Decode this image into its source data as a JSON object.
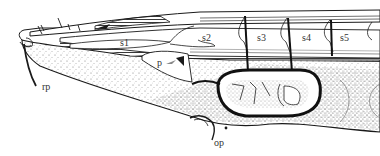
{
  "figure": {
    "type": "anatomical-illustration",
    "view": "lateral",
    "colors": {
      "ink": "#1a1a1a",
      "background": "#ffffff",
      "stipple": "#555555",
      "label": "#333333"
    },
    "labels": [
      {
        "id": "s1",
        "text": "s1",
        "x": 120,
        "y": 46
      },
      {
        "id": "s2",
        "text": "s2",
        "x": 202,
        "y": 41
      },
      {
        "id": "s3",
        "text": "s3",
        "x": 257,
        "y": 41
      },
      {
        "id": "s4",
        "text": "s4",
        "x": 302,
        "y": 41
      },
      {
        "id": "s5",
        "text": "s5",
        "x": 340,
        "y": 41
      },
      {
        "id": "p",
        "text": "p",
        "x": 157,
        "y": 66
      },
      {
        "id": "rp",
        "text": "rp",
        "x": 42,
        "y": 90
      },
      {
        "id": "op",
        "text": "op",
        "x": 214,
        "y": 144
      }
    ]
  }
}
